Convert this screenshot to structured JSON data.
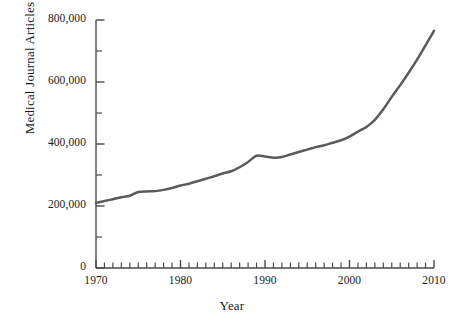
{
  "chart_data": {
    "type": "line",
    "title": "",
    "xlabel": "Year",
    "ylabel": "Medical Journal Articles",
    "xlim": [
      1970,
      2010
    ],
    "ylim": [
      0,
      800000
    ],
    "grid": false,
    "legend": null,
    "series_color": "#5b5b5b",
    "y_major_ticks": [
      0,
      200000,
      400000,
      600000,
      800000
    ],
    "y_major_tick_labels": [
      "0",
      "200,000",
      "400,000",
      "600,000",
      "800,000"
    ],
    "y_minor_ticks": [
      100000,
      300000,
      500000,
      700000
    ],
    "x_major_ticks": [
      1970,
      1980,
      1990,
      2000,
      2010
    ],
    "x_major_tick_labels": [
      "1970",
      "1980",
      "1990",
      "2000",
      "2010"
    ],
    "x_minor_tick_step": 1,
    "x": [
      1970,
      1971,
      1972,
      1973,
      1974,
      1975,
      1976,
      1977,
      1978,
      1979,
      1980,
      1981,
      1982,
      1983,
      1984,
      1985,
      1986,
      1987,
      1988,
      1989,
      1990,
      1991,
      1992,
      1993,
      1994,
      1995,
      1996,
      1997,
      1998,
      1999,
      2000,
      2001,
      2002,
      2003,
      2004,
      2005,
      2006,
      2007,
      2008,
      2009,
      2010
    ],
    "values": [
      210000,
      216000,
      222000,
      228000,
      233000,
      245000,
      247000,
      248000,
      252000,
      258000,
      266000,
      272000,
      280000,
      288000,
      296000,
      305000,
      312000,
      325000,
      342000,
      362000,
      360000,
      356000,
      358000,
      366000,
      374000,
      382000,
      390000,
      396000,
      404000,
      412000,
      424000,
      440000,
      455000,
      478000,
      512000,
      552000,
      590000,
      630000,
      672000,
      718000,
      765000
    ],
    "series": [
      {
        "name": "Medical Journal Articles",
        "color": "#5b5b5b",
        "line_width": 2.5
      }
    ]
  },
  "axes": {
    "y_axis_title": "Medical Journal Articles",
    "x_axis_title": "Year"
  },
  "caption": {
    "cropped_text": ""
  }
}
